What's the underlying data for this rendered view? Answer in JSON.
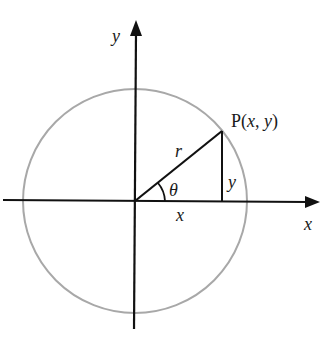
{
  "diagram": {
    "colors": {
      "axis": "#111111",
      "circle": "#a8a8a8",
      "radius": "#111111",
      "text": "#1a1a1a"
    },
    "origin": {
      "x": 135,
      "y": 201
    },
    "circle": {
      "cx": 135,
      "cy": 201,
      "r": 112
    },
    "point": {
      "x": 222,
      "y": 131
    },
    "labels": {
      "y_axis": "y",
      "x_axis": "x",
      "point_prefix": "P(",
      "point_x": "x",
      "point_sep": ", ",
      "point_y": "y",
      "point_suffix": ")",
      "radius": "r",
      "angle": "θ",
      "vertical_leg": "y",
      "horizontal_leg": "x"
    }
  }
}
